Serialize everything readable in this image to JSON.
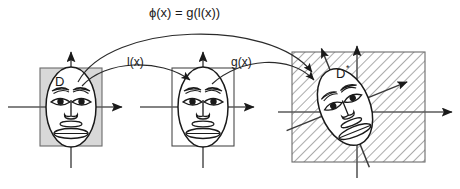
{
  "figure": {
    "title_label": "ϕ(x) = g(l(x))",
    "map_left_label": "l(x)",
    "map_right_label": "g(x)",
    "domain_label": "D",
    "codomain_label": "D",
    "codomain_star": "*",
    "colors": {
      "stroke": "#1a1a1a",
      "axis": "#555555",
      "panel_fill_gray": "#d8d8d8",
      "panel_fill_white": "#ffffff",
      "hatch_line": "#555555",
      "face_fill": "#ffffff",
      "background": "#ffffff"
    },
    "panels": [
      {
        "name": "source-panel",
        "region_label": "D",
        "region_fill": "gray",
        "face_rotation_deg": 0,
        "rect": {
          "x": 40,
          "y": 68,
          "w": 62,
          "h": 78
        }
      },
      {
        "name": "intermediate-panel",
        "region_label": "",
        "region_fill": "white",
        "face_rotation_deg": 0,
        "rect": {
          "x": 172,
          "y": 68,
          "w": 62,
          "h": 78
        }
      },
      {
        "name": "target-panel",
        "region_label": "D*",
        "region_fill": "hatched",
        "face_rotation_deg": -22,
        "rect": {
          "x": 292,
          "y": 52,
          "w": 133,
          "h": 110
        }
      }
    ],
    "arrows": [
      {
        "name": "phi-arc",
        "label": "ϕ(x) = g(l(x))",
        "from": "source-panel",
        "to": "target-panel"
      },
      {
        "name": "l-arc",
        "label": "l(x)",
        "from": "source-panel",
        "to": "intermediate-panel"
      },
      {
        "name": "g-arc",
        "label": "g(x)",
        "from": "intermediate-panel",
        "to": "target-panel"
      }
    ]
  }
}
